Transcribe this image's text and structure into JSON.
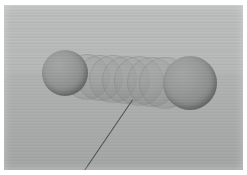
{
  "render": {
    "title": "3D Sphere Motion Trail Render",
    "width": 247,
    "height": 175,
    "background_color": "#b9bbbb",
    "frame_color": "#ffffff",
    "ground_color": "#a9abab",
    "grid_line_color": "#8c8f8f",
    "sphere_color": "#8e9090",
    "sphere_highlight_color": "#a3a5a5",
    "sphere_shadow_color": "#676969",
    "ghost_color": "#9b9d9d",
    "trajectory_color": "#4c4e4e"
  },
  "scene": {
    "label": "sphere-motion-trail",
    "ground_label": "perspective-grid-plane",
    "sky_label": "background-gradient"
  },
  "spheres": [
    {
      "name": "sphere-start",
      "cx": 65,
      "cy": 73,
      "r": 23,
      "ghost": false,
      "opacity": 1
    },
    {
      "name": "sphere-trail-1",
      "cx": 86,
      "cy": 76,
      "r": 22,
      "ghost": true,
      "opacity": 0.55
    },
    {
      "name": "sphere-trail-2",
      "cx": 99,
      "cy": 77,
      "r": 22,
      "ghost": true,
      "opacity": 0.55
    },
    {
      "name": "sphere-trail-3",
      "cx": 112,
      "cy": 78,
      "r": 23,
      "ghost": true,
      "opacity": 0.55
    },
    {
      "name": "sphere-trail-4",
      "cx": 125,
      "cy": 79,
      "r": 23,
      "ghost": true,
      "opacity": 0.55
    },
    {
      "name": "sphere-trail-5",
      "cx": 138,
      "cy": 80,
      "r": 24,
      "ghost": true,
      "opacity": 0.55
    },
    {
      "name": "sphere-trail-6",
      "cx": 151,
      "cy": 81,
      "r": 24,
      "ghost": true,
      "opacity": 0.55
    },
    {
      "name": "sphere-trail-7",
      "cx": 164,
      "cy": 82,
      "r": 25,
      "ghost": true,
      "opacity": 0.55
    },
    {
      "name": "sphere-end",
      "cx": 190,
      "cy": 83,
      "r": 27,
      "ghost": false,
      "opacity": 1
    }
  ],
  "trajectory": {
    "name": "trajectory-line",
    "x1": 133,
    "y1": 100,
    "x2": 82,
    "y2": 175,
    "thickness": 1.4
  }
}
